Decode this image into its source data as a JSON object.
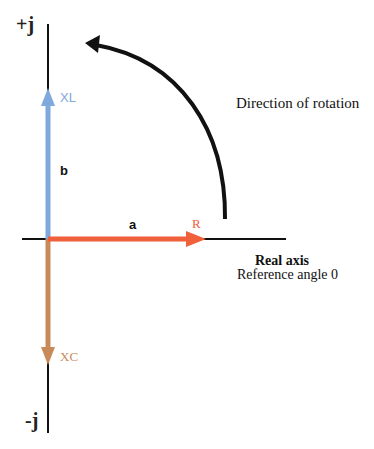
{
  "diagram": {
    "corner_text": "",
    "axes": {
      "imag_positive_label": "+j",
      "imag_negative_label": "-j",
      "real_axis_label": "Real axis",
      "reference_label": "Reference angle 0"
    },
    "phasors": [
      {
        "name": "R",
        "label": "R",
        "direction": "right",
        "color": "#f0603a"
      },
      {
        "name": "XL",
        "label": "XL",
        "direction": "up",
        "color": "#7fa8dc"
      },
      {
        "name": "XC",
        "label": "XC",
        "direction": "down",
        "color": "#c98a5a"
      }
    ],
    "segment_labels": {
      "a": "a",
      "b": "b"
    },
    "rotation": {
      "label": "Direction of rotation",
      "sense": "counter-clockwise",
      "color": "#111111"
    },
    "colors": {
      "axis": "#111111",
      "background": "#ffffff"
    }
  }
}
